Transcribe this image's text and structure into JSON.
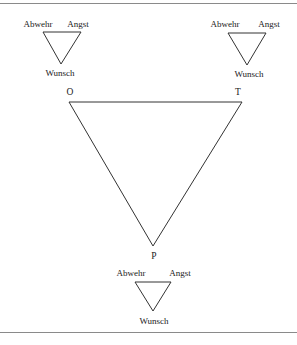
{
  "figure": {
    "main_triangle": {
      "vertices": {
        "top_left": "O",
        "top_right": "T",
        "bottom": "P"
      }
    },
    "small_triangles": [
      {
        "position": "top-left",
        "top_left": "Abwehr",
        "top_right": "Angst",
        "bottom": "Wunsch"
      },
      {
        "position": "top-right",
        "top_left": "Abwehr",
        "top_right": "Angst",
        "bottom": "Wunsch"
      },
      {
        "position": "bottom-center",
        "top_left": "Abwehr",
        "top_right": "Angst",
        "bottom": "Wunsch"
      }
    ],
    "line_color": "#333333",
    "rule_color": "#8a8a8a"
  }
}
